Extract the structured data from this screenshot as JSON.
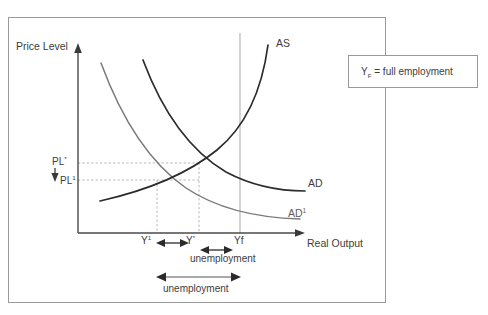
{
  "figure": {
    "axes": {
      "y_axis_label": "Price Level",
      "x_axis_label": "Real Output"
    },
    "curves": [
      {
        "id": "as",
        "label": "AS",
        "label_sup": "",
        "color": "#2b2b2b",
        "description": "aggregate supply, upward sloping"
      },
      {
        "id": "ad",
        "label": "AD",
        "label_sup": "",
        "color": "#2b2b2b",
        "description": "original aggregate demand, downward sloping"
      },
      {
        "id": "ad1",
        "label": "AD",
        "label_sup": "1",
        "color": "#7a7a7a",
        "description": "shifted aggregate demand, downward sloping"
      }
    ],
    "price_levels": [
      {
        "id": "pl-star",
        "label": "PL",
        "sup": "*"
      },
      {
        "id": "pl-1",
        "label": "PL",
        "sup": "1"
      }
    ],
    "output_levels": [
      {
        "id": "y-1",
        "label": "Y",
        "sup": "1"
      },
      {
        "id": "y-star",
        "label": "Y",
        "sup": "*"
      },
      {
        "id": "y-f",
        "label": "Yf",
        "sup": ""
      }
    ],
    "annotations": [
      {
        "id": "unemployment-1",
        "text": "unemployment"
      },
      {
        "id": "unemployment-2",
        "text": "unemployment"
      }
    ],
    "legend": {
      "symbol": "Y",
      "symbol_sub": "F",
      "text": " = full employment"
    },
    "colors": {
      "curve_dark": "#2b2b2b",
      "curve_gray": "#7a7a7a",
      "guide_dotted": "#b4b4b4",
      "frame": "#9a9a9a",
      "axis": "#4a4a4a",
      "text": "#3d3d3d",
      "background": "#ffffff"
    }
  }
}
